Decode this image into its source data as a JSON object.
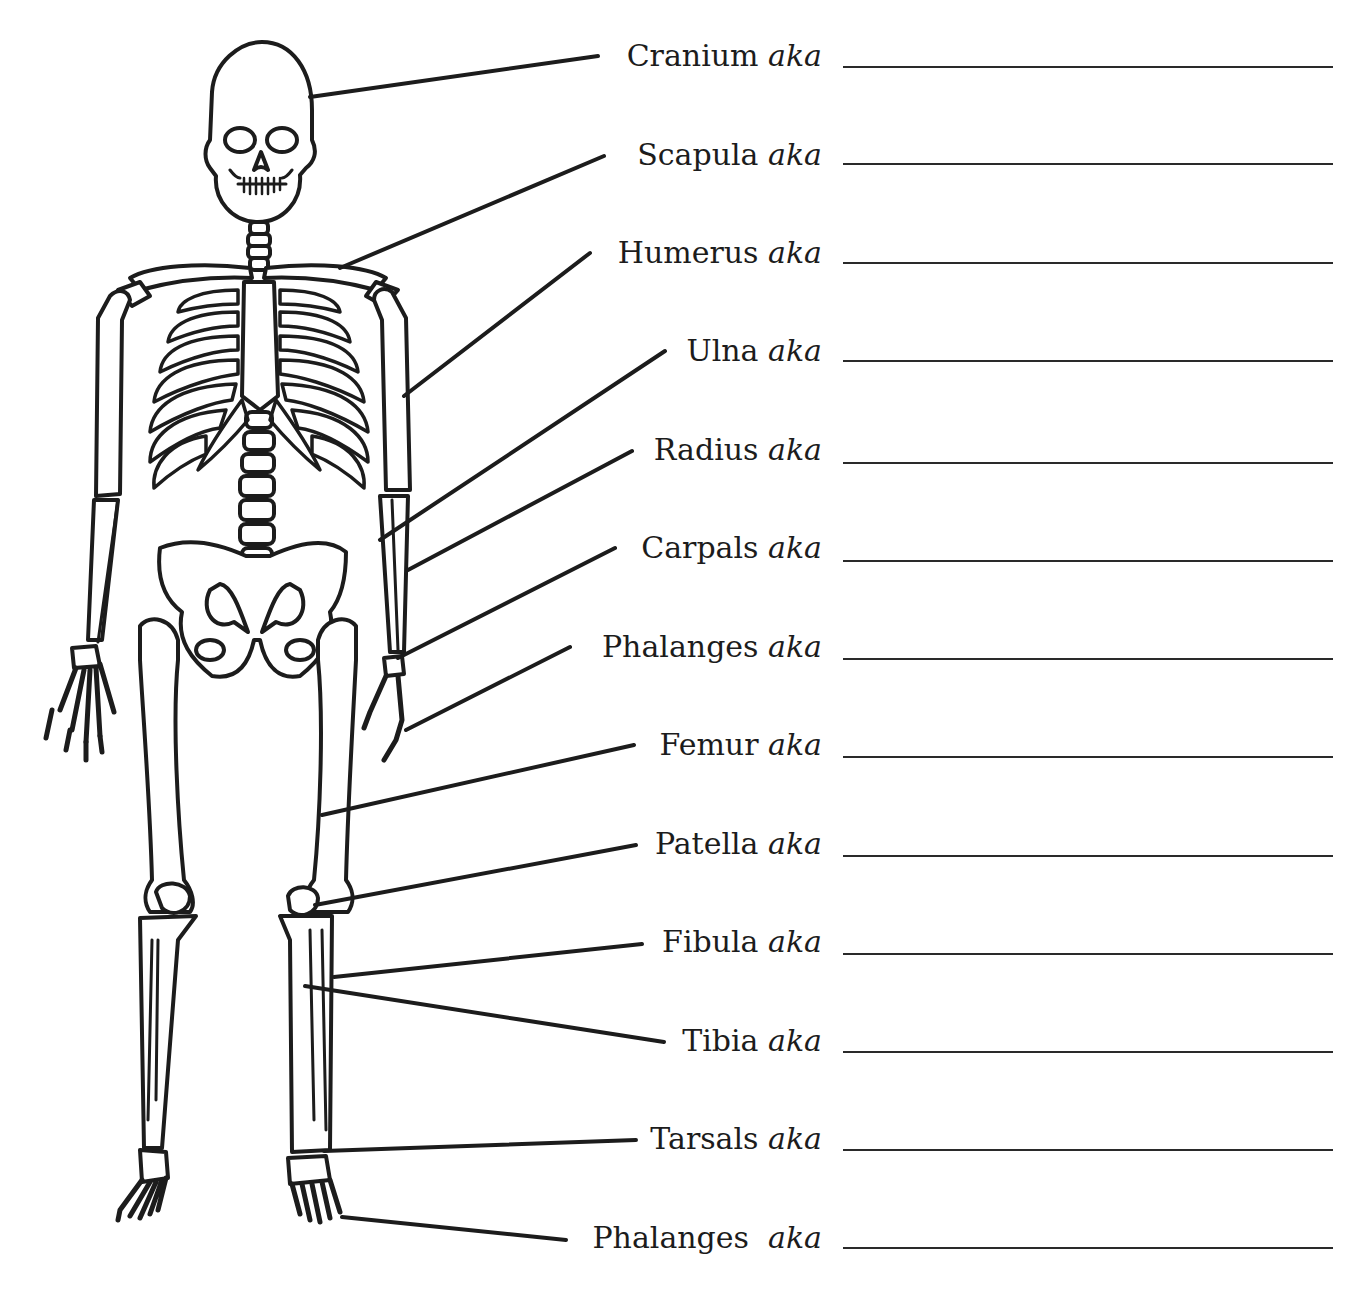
{
  "worksheet": {
    "suffix": "aka",
    "colors": {
      "ink": "#1c1c1c",
      "paper": "#ffffff"
    },
    "labels": [
      {
        "name": "Cranium",
        "label_right": 822,
        "y": 56,
        "leader": [
          [
            598,
            56
          ],
          [
            310,
            97
          ]
        ],
        "line": [
          843,
          1333,
          66
        ]
      },
      {
        "name": "Scapula",
        "label_right": 822,
        "y": 155,
        "leader": [
          [
            604,
            156
          ],
          [
            340,
            268
          ]
        ],
        "line": [
          843,
          1333,
          163
        ]
      },
      {
        "name": "Humerus",
        "label_right": 822,
        "y": 253,
        "leader": [
          [
            590,
            253
          ],
          [
            404,
            396
          ]
        ],
        "line": [
          843,
          1333,
          262
        ]
      },
      {
        "name": "Ulna",
        "label_right": 822,
        "y": 351,
        "leader": [
          [
            665,
            351
          ],
          [
            380,
            540
          ]
        ],
        "line": [
          843,
          1333,
          360
        ]
      },
      {
        "name": "Radius",
        "label_right": 822,
        "y": 450,
        "leader": [
          [
            632,
            451
          ],
          [
            408,
            570
          ]
        ],
        "line": [
          843,
          1333,
          462
        ]
      },
      {
        "name": "Carpals",
        "label_right": 822,
        "y": 548,
        "leader": [
          [
            615,
            548
          ],
          [
            398,
            658
          ]
        ],
        "line": [
          843,
          1333,
          560
        ]
      },
      {
        "name": "Phalanges",
        "label_right": 822,
        "y": 647,
        "leader": [
          [
            570,
            647
          ],
          [
            406,
            730
          ]
        ],
        "line": [
          843,
          1333,
          658
        ]
      },
      {
        "name": "Femur",
        "label_right": 822,
        "y": 745,
        "leader": [
          [
            634,
            745
          ],
          [
            322,
            815
          ]
        ],
        "line": [
          843,
          1333,
          756
        ]
      },
      {
        "name": "Patella",
        "label_right": 822,
        "y": 844,
        "leader": [
          [
            636,
            845
          ],
          [
            315,
            905
          ]
        ],
        "line": [
          843,
          1333,
          855
        ]
      },
      {
        "name": "Fibula",
        "label_right": 822,
        "y": 942,
        "leader": [
          [
            642,
            944
          ],
          [
            334,
            977
          ]
        ],
        "line": [
          843,
          1333,
          953
        ]
      },
      {
        "name": "Tibia",
        "label_right": 822,
        "y": 1041,
        "leader": [
          [
            664,
            1042
          ],
          [
            305,
            986
          ]
        ],
        "line": [
          843,
          1333,
          1051
        ]
      },
      {
        "name": "Tarsals",
        "label_right": 822,
        "y": 1139,
        "leader": [
          [
            636,
            1140
          ],
          [
            324,
            1151
          ]
        ],
        "line": [
          843,
          1333,
          1149
        ]
      },
      {
        "name": "Phalanges",
        "label_right": 822,
        "y": 1238,
        "leader": [
          [
            566,
            1240
          ],
          [
            342,
            1217
          ]
        ],
        "line": [
          843,
          1333,
          1247
        ],
        "suffix_gap": true
      }
    ]
  }
}
